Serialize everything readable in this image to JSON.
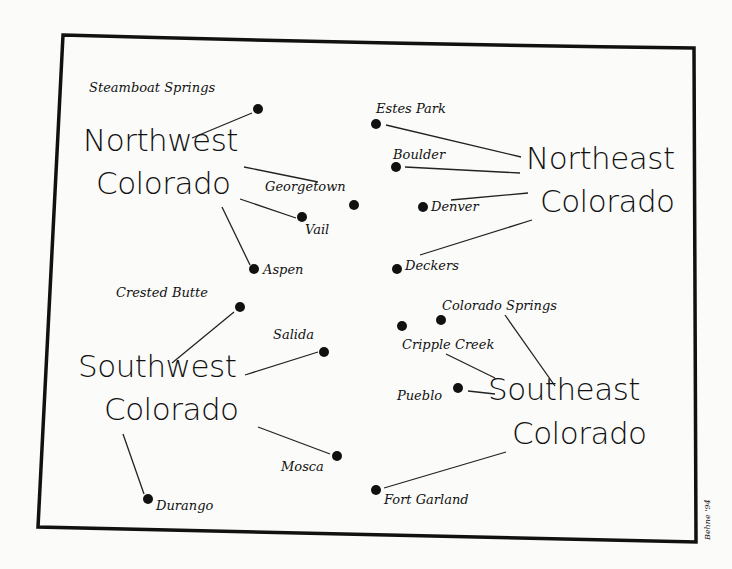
{
  "map": {
    "title": "Colorado regions",
    "border_color": "#111111",
    "background": "#fbfbf9",
    "signature": "Behne '94",
    "regions": [
      {
        "name_line1": "Northwest",
        "name_line2": "Colorado"
      },
      {
        "name_line1": "Northeast",
        "name_line2": "Colorado"
      },
      {
        "name_line1": "Southwest",
        "name_line2": "Colorado"
      },
      {
        "name_line1": "Southeast",
        "name_line2": "Colorado"
      }
    ],
    "towns": {
      "steamboat": "Steamboat Springs",
      "georgetown": "Georgetown",
      "vail": "Vail",
      "aspen": "Aspen",
      "estes": "Estes Park",
      "boulder": "Boulder",
      "denver": "Denver",
      "deckers": "Deckers",
      "crested": "Crested Butte",
      "salida": "Salida",
      "mosca": "Mosca",
      "durango": "Durango",
      "cosprings": "Colorado Springs",
      "cripple": "Cripple Creek",
      "pueblo": "Pueblo",
      "fortgarland": "Fort Garland"
    }
  }
}
